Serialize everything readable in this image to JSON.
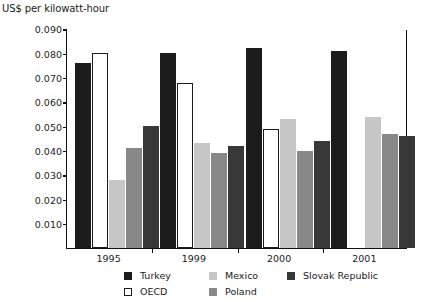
{
  "chart_data": {
    "type": "bar",
    "title": "",
    "subtitle": "",
    "xlabel": "",
    "ylabel": "US$ per kilowatt-hour",
    "categories": [
      "1995",
      "1999",
      "2000",
      "2001"
    ],
    "ylim": [
      0,
      0.09
    ],
    "ytick_labels": [
      "0.090",
      "0.080",
      "0.070",
      "0.060",
      "0.050",
      "0.040",
      "0.030",
      "0.020",
      "0.010"
    ],
    "ytick_values": [
      0.09,
      0.08,
      0.07,
      0.06,
      0.05,
      0.04,
      0.03,
      0.02,
      0.01
    ],
    "grid": false,
    "legend_position": "bottom",
    "series": [
      {
        "name": "Turkey",
        "color": "#1c1c1c",
        "values": [
          0.076,
          0.08,
          0.082,
          0.081
        ]
      },
      {
        "name": "OECD",
        "color": "#ffffff",
        "values": [
          0.08,
          0.068,
          0.049,
          null
        ]
      },
      {
        "name": "Mexico",
        "color": "#c6c6c6",
        "values": [
          0.028,
          0.043,
          0.053,
          0.054
        ]
      },
      {
        "name": "Poland",
        "color": "#888888",
        "values": [
          0.041,
          0.039,
          0.04,
          0.047
        ]
      },
      {
        "name": "Slovak Republic",
        "color": "#383838",
        "values": [
          0.05,
          0.042,
          0.044,
          0.046
        ]
      }
    ]
  },
  "legend": {
    "rows": [
      [
        {
          "label": "Turkey",
          "swatch": "sw-turkey"
        },
        {
          "label": "Mexico",
          "swatch": "sw-mexico"
        },
        {
          "label": "Slovak Republic",
          "swatch": "sw-slovak"
        }
      ],
      [
        {
          "label": "OECD",
          "swatch": "sw-oecd"
        },
        {
          "label": "Poland",
          "swatch": "sw-poland"
        }
      ]
    ]
  }
}
